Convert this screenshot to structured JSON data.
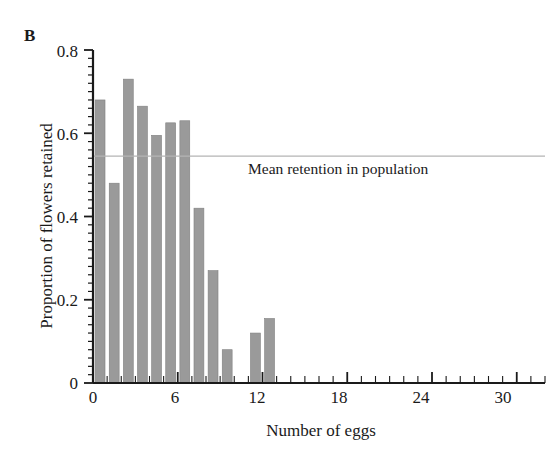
{
  "figure": {
    "panel_label": "B",
    "background_color": "#ffffff",
    "bar_color": "#9a9a9a",
    "bar_edge_color": "#808080",
    "axis_color": "#1a1a1a",
    "mean_line_color": "#b4b4b4"
  },
  "chart_data": {
    "type": "bar",
    "title": "",
    "xlabel": "Number of eggs",
    "ylabel": "Proportion of flowers retained",
    "xlim": [
      0,
      32
    ],
    "ylim": [
      0,
      0.8
    ],
    "grid": false,
    "legend_position": "none",
    "x_major_ticks": [
      0,
      6,
      12,
      18,
      24,
      30
    ],
    "x_major_tick_labels": [
      "0",
      "6",
      "12",
      "18",
      "24",
      "30"
    ],
    "x_minor_tick_step": 1,
    "y_major_ticks": [
      0,
      0.2,
      0.4,
      0.6,
      0.8
    ],
    "y_major_tick_labels": [
      "0",
      "0.2",
      "0.4",
      "0.6",
      "0.8"
    ],
    "y_minor_tick_step": 0.02,
    "categories": [
      0,
      1,
      2,
      3,
      4,
      5,
      6,
      7,
      8,
      9,
      11,
      12
    ],
    "values": [
      0.68,
      0.48,
      0.73,
      0.665,
      0.595,
      0.625,
      0.63,
      0.42,
      0.27,
      0.08,
      0.12,
      0.155
    ],
    "annotations": [
      {
        "name": "mean-retention-line",
        "label": "Mean retention in population",
        "y_value": 0.545,
        "type": "horizontal-line"
      }
    ]
  }
}
